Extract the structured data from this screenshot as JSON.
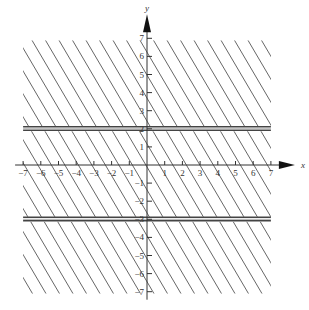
{
  "chart_data": {
    "type": "line",
    "title": "",
    "xlabel": "x",
    "ylabel": "y",
    "xlim": [
      -7,
      7
    ],
    "ylim": [
      -7,
      7
    ],
    "x_ticks": [
      -7,
      -6,
      -5,
      -4,
      -3,
      -2,
      -1,
      1,
      2,
      3,
      4,
      5,
      6,
      7
    ],
    "y_ticks": [
      -7,
      -6,
      -5,
      -4,
      -3,
      -2,
      -1,
      1,
      2,
      3,
      4,
      5,
      6,
      7
    ],
    "grid": false,
    "series": [
      {
        "name": "boundary y = 2",
        "type": "horizontal_line",
        "y": 2,
        "style": "double solid"
      },
      {
        "name": "boundary y = -3",
        "type": "horizontal_line",
        "y": -3,
        "style": "double solid"
      }
    ],
    "shaded_regions": [
      {
        "description": "y >= 2",
        "pattern": "diagonal hatching"
      },
      {
        "description": "y <= -3",
        "pattern": "diagonal hatching"
      },
      {
        "description": "-3 < y < 2",
        "pattern": "diagonal hatching"
      }
    ],
    "annotation": "Entire plane hatched; double horizontal lines at y = 2 and y = -3"
  },
  "axes": {
    "x_label": "x",
    "y_label": "y"
  }
}
